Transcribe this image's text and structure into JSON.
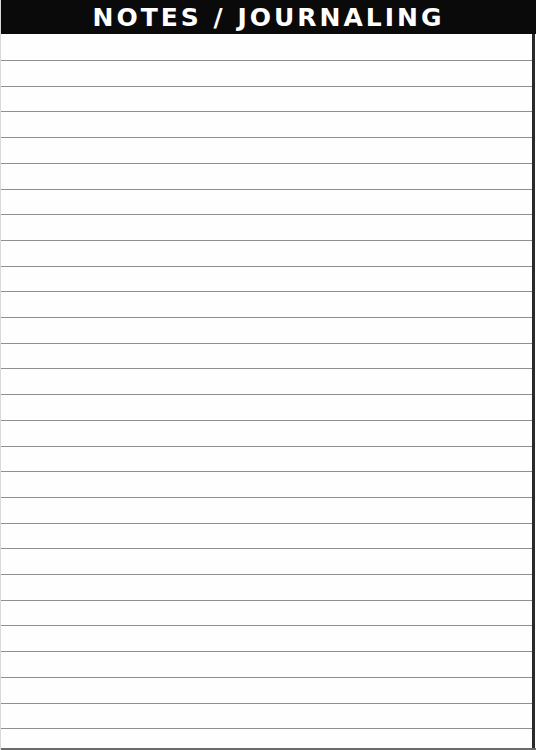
{
  "header": {
    "title": "NOTES / JOURNALING",
    "background": "#0a0a0a",
    "text_color": "#ffffff"
  },
  "ruled_area": {
    "line_count": 27,
    "first_line_y": 60,
    "line_spacing": 25.7,
    "line_color": "#8f8f8f"
  }
}
